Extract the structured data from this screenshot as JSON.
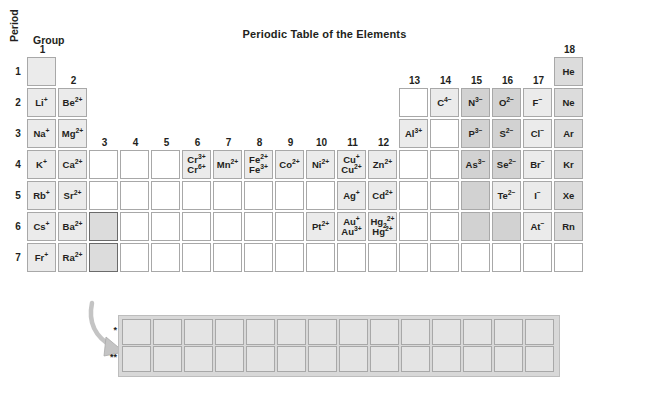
{
  "title": "Periodic Table of the Elements",
  "axes": {
    "period_label": "Period",
    "group_label": "Group"
  },
  "periods": [
    "1",
    "2",
    "3",
    "4",
    "5",
    "6",
    "7"
  ],
  "groups": [
    "1",
    "2",
    "3",
    "4",
    "5",
    "6",
    "7",
    "8",
    "9",
    "10",
    "11",
    "12",
    "13",
    "14",
    "15",
    "16",
    "17",
    "18"
  ],
  "footnote_marks": {
    "lanthanide": "*",
    "actinide": "**"
  },
  "fblock": {
    "row_count": 2,
    "columns": 14,
    "lanthanide_cells": [
      "",
      "",
      "",
      "",
      "",
      "",
      "",
      "",
      "",
      "",
      "",
      "",
      "",
      ""
    ],
    "actinide_cells": [
      "",
      "",
      "",
      "",
      "",
      "",
      "",
      "",
      "",
      "",
      "",
      "",
      "",
      ""
    ]
  },
  "colors": {
    "cell_border": "#a8a8a8",
    "shade_light": "#ebebeb",
    "shade_medium": "#dcdcdc",
    "shade_dark": "#d2d2d2",
    "marked_border": "#6b6b6b",
    "arrow": "#bfbfbf",
    "text": "#231f20",
    "background": "#ffffff"
  },
  "cells": [
    {
      "group": 1,
      "period": 1,
      "shade": "sh1",
      "ions": []
    },
    {
      "group": 18,
      "period": 1,
      "shade": "sh2",
      "ions": [
        "He"
      ]
    },
    {
      "group": 1,
      "period": 2,
      "shade": "sh1",
      "ions": [
        "Li<sup>+</sup>"
      ]
    },
    {
      "group": 2,
      "period": 2,
      "shade": "sh1",
      "ions": [
        "Be<sup>2+</sup>"
      ]
    },
    {
      "group": 13,
      "period": 2,
      "shade": "none",
      "ions": []
    },
    {
      "group": 14,
      "period": 2,
      "shade": "sh1",
      "ions": [
        "C<sup>4&#8722;</sup>"
      ]
    },
    {
      "group": 15,
      "period": 2,
      "shade": "sh3",
      "ions": [
        "N<sup>3&#8722;</sup>"
      ]
    },
    {
      "group": 16,
      "period": 2,
      "shade": "sh3",
      "ions": [
        "O<sup>2&#8722;</sup>"
      ]
    },
    {
      "group": 17,
      "period": 2,
      "shade": "sh1",
      "ions": [
        "F<sup>&#8722;</sup>"
      ]
    },
    {
      "group": 18,
      "period": 2,
      "shade": "sh2",
      "ions": [
        "Ne"
      ]
    },
    {
      "group": 1,
      "period": 3,
      "shade": "sh1",
      "ions": [
        "Na<sup>+</sup>"
      ]
    },
    {
      "group": 2,
      "period": 3,
      "shade": "sh1",
      "ions": [
        "Mg<sup>2+</sup>"
      ]
    },
    {
      "group": 13,
      "period": 3,
      "shade": "sh1",
      "ions": [
        "Al<sup>3+</sup>"
      ]
    },
    {
      "group": 14,
      "period": 3,
      "shade": "none",
      "ions": []
    },
    {
      "group": 15,
      "period": 3,
      "shade": "sh3",
      "ions": [
        "P<sup>3&#8722;</sup>"
      ]
    },
    {
      "group": 16,
      "period": 3,
      "shade": "sh3",
      "ions": [
        "S<sup>2&#8722;</sup>"
      ]
    },
    {
      "group": 17,
      "period": 3,
      "shade": "sh1",
      "ions": [
        "Cl<sup>&#8722;</sup>"
      ]
    },
    {
      "group": 18,
      "period": 3,
      "shade": "sh2",
      "ions": [
        "Ar"
      ]
    },
    {
      "group": 1,
      "period": 4,
      "shade": "sh1",
      "ions": [
        "K<sup>+</sup>"
      ]
    },
    {
      "group": 2,
      "period": 4,
      "shade": "sh1",
      "ions": [
        "Ca<sup>2+</sup>"
      ]
    },
    {
      "group": 3,
      "period": 4,
      "shade": "none",
      "ions": []
    },
    {
      "group": 4,
      "period": 4,
      "shade": "none",
      "ions": []
    },
    {
      "group": 5,
      "period": 4,
      "shade": "none",
      "ions": []
    },
    {
      "group": 6,
      "period": 4,
      "shade": "sh1",
      "ions": [
        "Cr<sup>3+</sup>",
        "Cr<sup>6+</sup>"
      ]
    },
    {
      "group": 7,
      "period": 4,
      "shade": "sh1",
      "ions": [
        "Mn<sup>2+</sup>"
      ]
    },
    {
      "group": 8,
      "period": 4,
      "shade": "sh1",
      "ions": [
        "Fe<sup>2+</sup>",
        "Fe<sup>3+</sup>"
      ]
    },
    {
      "group": 9,
      "period": 4,
      "shade": "sh1",
      "ions": [
        "Co<sup>2+</sup>"
      ]
    },
    {
      "group": 10,
      "period": 4,
      "shade": "sh1",
      "ions": [
        "Ni<sup>2+</sup>"
      ]
    },
    {
      "group": 11,
      "period": 4,
      "shade": "sh1",
      "ions": [
        "Cu<sup>+</sup>",
        "Cu<sup>2+</sup>"
      ]
    },
    {
      "group": 12,
      "period": 4,
      "shade": "sh1",
      "ions": [
        "Zn<sup>2+</sup>"
      ]
    },
    {
      "group": 13,
      "period": 4,
      "shade": "none",
      "ions": []
    },
    {
      "group": 14,
      "period": 4,
      "shade": "none",
      "ions": []
    },
    {
      "group": 15,
      "period": 4,
      "shade": "sh3",
      "ions": [
        "As<sup>3&#8722;</sup>"
      ]
    },
    {
      "group": 16,
      "period": 4,
      "shade": "sh3",
      "ions": [
        "Se<sup>2&#8722;</sup>"
      ]
    },
    {
      "group": 17,
      "period": 4,
      "shade": "sh1",
      "ions": [
        "Br<sup>&#8722;</sup>"
      ]
    },
    {
      "group": 18,
      "period": 4,
      "shade": "sh2",
      "ions": [
        "Kr"
      ]
    },
    {
      "group": 1,
      "period": 5,
      "shade": "sh1",
      "ions": [
        "Rb<sup>+</sup>"
      ]
    },
    {
      "group": 2,
      "period": 5,
      "shade": "sh1",
      "ions": [
        "Sr<sup>2+</sup>"
      ]
    },
    {
      "group": 3,
      "period": 5,
      "shade": "none",
      "ions": []
    },
    {
      "group": 4,
      "period": 5,
      "shade": "none",
      "ions": []
    },
    {
      "group": 5,
      "period": 5,
      "shade": "none",
      "ions": []
    },
    {
      "group": 6,
      "period": 5,
      "shade": "none",
      "ions": []
    },
    {
      "group": 7,
      "period": 5,
      "shade": "none",
      "ions": []
    },
    {
      "group": 8,
      "period": 5,
      "shade": "none",
      "ions": []
    },
    {
      "group": 9,
      "period": 5,
      "shade": "none",
      "ions": []
    },
    {
      "group": 10,
      "period": 5,
      "shade": "none",
      "ions": []
    },
    {
      "group": 11,
      "period": 5,
      "shade": "sh1",
      "ions": [
        "Ag<sup>+</sup>"
      ]
    },
    {
      "group": 12,
      "period": 5,
      "shade": "sh1",
      "ions": [
        "Cd<sup>2+</sup>"
      ]
    },
    {
      "group": 13,
      "period": 5,
      "shade": "none",
      "ions": []
    },
    {
      "group": 14,
      "period": 5,
      "shade": "none",
      "ions": []
    },
    {
      "group": 15,
      "period": 5,
      "shade": "sh3",
      "ions": []
    },
    {
      "group": 16,
      "period": 5,
      "shade": "sh1",
      "ions": [
        "Te<sup>2&#8722;</sup>"
      ]
    },
    {
      "group": 17,
      "period": 5,
      "shade": "sh1",
      "ions": [
        "I<sup>&#8722;</sup>"
      ]
    },
    {
      "group": 18,
      "period": 5,
      "shade": "sh2",
      "ions": [
        "Xe"
      ]
    },
    {
      "group": 1,
      "period": 6,
      "shade": "sh1",
      "ions": [
        "Cs<sup>+</sup>"
      ]
    },
    {
      "group": 2,
      "period": 6,
      "shade": "sh1",
      "ions": [
        "Ba<sup>2+</sup>"
      ]
    },
    {
      "group": 3,
      "period": 6,
      "shade": "marked",
      "ions": []
    },
    {
      "group": 4,
      "period": 6,
      "shade": "none",
      "ions": []
    },
    {
      "group": 5,
      "period": 6,
      "shade": "none",
      "ions": []
    },
    {
      "group": 6,
      "period": 6,
      "shade": "none",
      "ions": []
    },
    {
      "group": 7,
      "period": 6,
      "shade": "none",
      "ions": []
    },
    {
      "group": 8,
      "period": 6,
      "shade": "none",
      "ions": []
    },
    {
      "group": 9,
      "period": 6,
      "shade": "none",
      "ions": []
    },
    {
      "group": 10,
      "period": 6,
      "shade": "sh1",
      "ions": [
        "Pt<sup>2+</sup>"
      ]
    },
    {
      "group": 11,
      "period": 6,
      "shade": "sh1",
      "ions": [
        "Au<sup>+</sup>",
        "Au<sup>3+</sup>"
      ]
    },
    {
      "group": 12,
      "period": 6,
      "shade": "sh1",
      "ions": [
        "Hg<sub>2</sub><sup>2+</sup>",
        "Hg<sup>2+</sup>"
      ]
    },
    {
      "group": 13,
      "period": 6,
      "shade": "none",
      "ions": []
    },
    {
      "group": 14,
      "period": 6,
      "shade": "none",
      "ions": []
    },
    {
      "group": 15,
      "period": 6,
      "shade": "sh3",
      "ions": []
    },
    {
      "group": 16,
      "period": 6,
      "shade": "sh3",
      "ions": []
    },
    {
      "group": 17,
      "period": 6,
      "shade": "sh1",
      "ions": [
        "At<sup>&#8722;</sup>"
      ]
    },
    {
      "group": 18,
      "period": 6,
      "shade": "sh2",
      "ions": [
        "Rn"
      ]
    },
    {
      "group": 1,
      "period": 7,
      "shade": "sh1",
      "ions": [
        "Fr<sup>+</sup>"
      ]
    },
    {
      "group": 2,
      "period": 7,
      "shade": "sh1",
      "ions": [
        "Ra<sup>2+</sup>"
      ]
    },
    {
      "group": 3,
      "period": 7,
      "shade": "marked",
      "ions": []
    },
    {
      "group": 4,
      "period": 7,
      "shade": "none",
      "ions": []
    },
    {
      "group": 5,
      "period": 7,
      "shade": "none",
      "ions": []
    },
    {
      "group": 6,
      "period": 7,
      "shade": "none",
      "ions": []
    },
    {
      "group": 7,
      "period": 7,
      "shade": "none",
      "ions": []
    },
    {
      "group": 8,
      "period": 7,
      "shade": "none",
      "ions": []
    },
    {
      "group": 9,
      "period": 7,
      "shade": "none",
      "ions": []
    },
    {
      "group": 10,
      "period": 7,
      "shade": "none",
      "ions": []
    },
    {
      "group": 11,
      "period": 7,
      "shade": "none",
      "ions": []
    },
    {
      "group": 12,
      "period": 7,
      "shade": "none",
      "ions": []
    },
    {
      "group": 13,
      "period": 7,
      "shade": "none",
      "ions": []
    },
    {
      "group": 14,
      "period": 7,
      "shade": "none",
      "ions": []
    },
    {
      "group": 15,
      "period": 7,
      "shade": "none",
      "ions": []
    },
    {
      "group": 16,
      "period": 7,
      "shade": "none",
      "ions": []
    },
    {
      "group": 17,
      "period": 7,
      "shade": "none",
      "ions": []
    },
    {
      "group": 18,
      "period": 7,
      "shade": "none",
      "ions": []
    }
  ]
}
